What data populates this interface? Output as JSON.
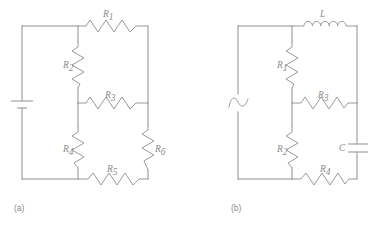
{
  "figure": {
    "background_color": "#ffffff",
    "line_color": "#8f8f8f",
    "label_color": "#8c8c8c",
    "width": 378,
    "height": 228
  },
  "panels": [
    {
      "id": "panel-a",
      "caption": "(a)",
      "caption_x": 14,
      "caption_y": 211,
      "source": {
        "type": "battery",
        "name": "dc-battery-source",
        "x": 22,
        "y": 104
      },
      "components": [
        {
          "id": "R1",
          "label": "R",
          "subscript": "1",
          "type": "resistor",
          "orientation": "horizontal",
          "label_x": 103,
          "label_y": 17
        },
        {
          "id": "R2",
          "label": "R",
          "subscript": "2",
          "type": "resistor",
          "orientation": "vertical",
          "label_x": 63,
          "label_y": 68
        },
        {
          "id": "R3",
          "label": "R",
          "subscript": "3",
          "type": "resistor",
          "orientation": "horizontal",
          "label_x": 105,
          "label_y": 98
        },
        {
          "id": "R4",
          "label": "R",
          "subscript": "4",
          "type": "resistor",
          "orientation": "vertical",
          "label_x": 63,
          "label_y": 152
        },
        {
          "id": "R5",
          "label": "R",
          "subscript": "5",
          "type": "resistor",
          "orientation": "horizontal",
          "label_x": 107,
          "label_y": 172
        },
        {
          "id": "R6",
          "label": "R",
          "subscript": "6",
          "type": "resistor",
          "orientation": "vertical",
          "label_x": 155,
          "label_y": 152
        }
      ]
    },
    {
      "id": "panel-b",
      "caption": "(b)",
      "caption_x": 231,
      "caption_y": 211,
      "source": {
        "type": "ac-sine",
        "name": "ac-voltage-source",
        "x": 238,
        "y": 104
      },
      "components": [
        {
          "id": "L",
          "label": "L",
          "subscript": "",
          "type": "inductor",
          "orientation": "horizontal",
          "label_x": 320,
          "label_y": 17
        },
        {
          "id": "R1",
          "label": "R",
          "subscript": "1",
          "type": "resistor",
          "orientation": "vertical",
          "label_x": 277,
          "label_y": 68
        },
        {
          "id": "R3",
          "label": "R",
          "subscript": "3",
          "type": "resistor",
          "orientation": "horizontal",
          "label_x": 318,
          "label_y": 98
        },
        {
          "id": "R2",
          "label": "R",
          "subscript": "2",
          "type": "resistor",
          "orientation": "vertical",
          "label_x": 277,
          "label_y": 152
        },
        {
          "id": "C",
          "label": "C",
          "subscript": "",
          "type": "capacitor",
          "orientation": "vertical",
          "label_x": 339,
          "label_y": 151
        },
        {
          "id": "R4",
          "label": "R",
          "subscript": "4",
          "type": "resistor",
          "orientation": "horizontal",
          "label_x": 320,
          "label_y": 172
        }
      ]
    }
  ]
}
